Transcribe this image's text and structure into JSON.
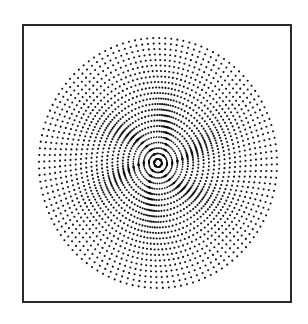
{
  "figure": {
    "kind": "radial-dot-pattern",
    "frame_color": "#2a2a2a",
    "dot_color": "#111111",
    "background": "#ffffff",
    "center": [
      158,
      163
    ],
    "radius_x": 119,
    "radius_y": 125,
    "spoke_count": 120,
    "dot_spacing": 5.5,
    "dot_radius": 1.05,
    "inner_radius": 4,
    "twist_strength": 0.9,
    "twist_falloff": 28,
    "pinwheel_arms": 6
  }
}
